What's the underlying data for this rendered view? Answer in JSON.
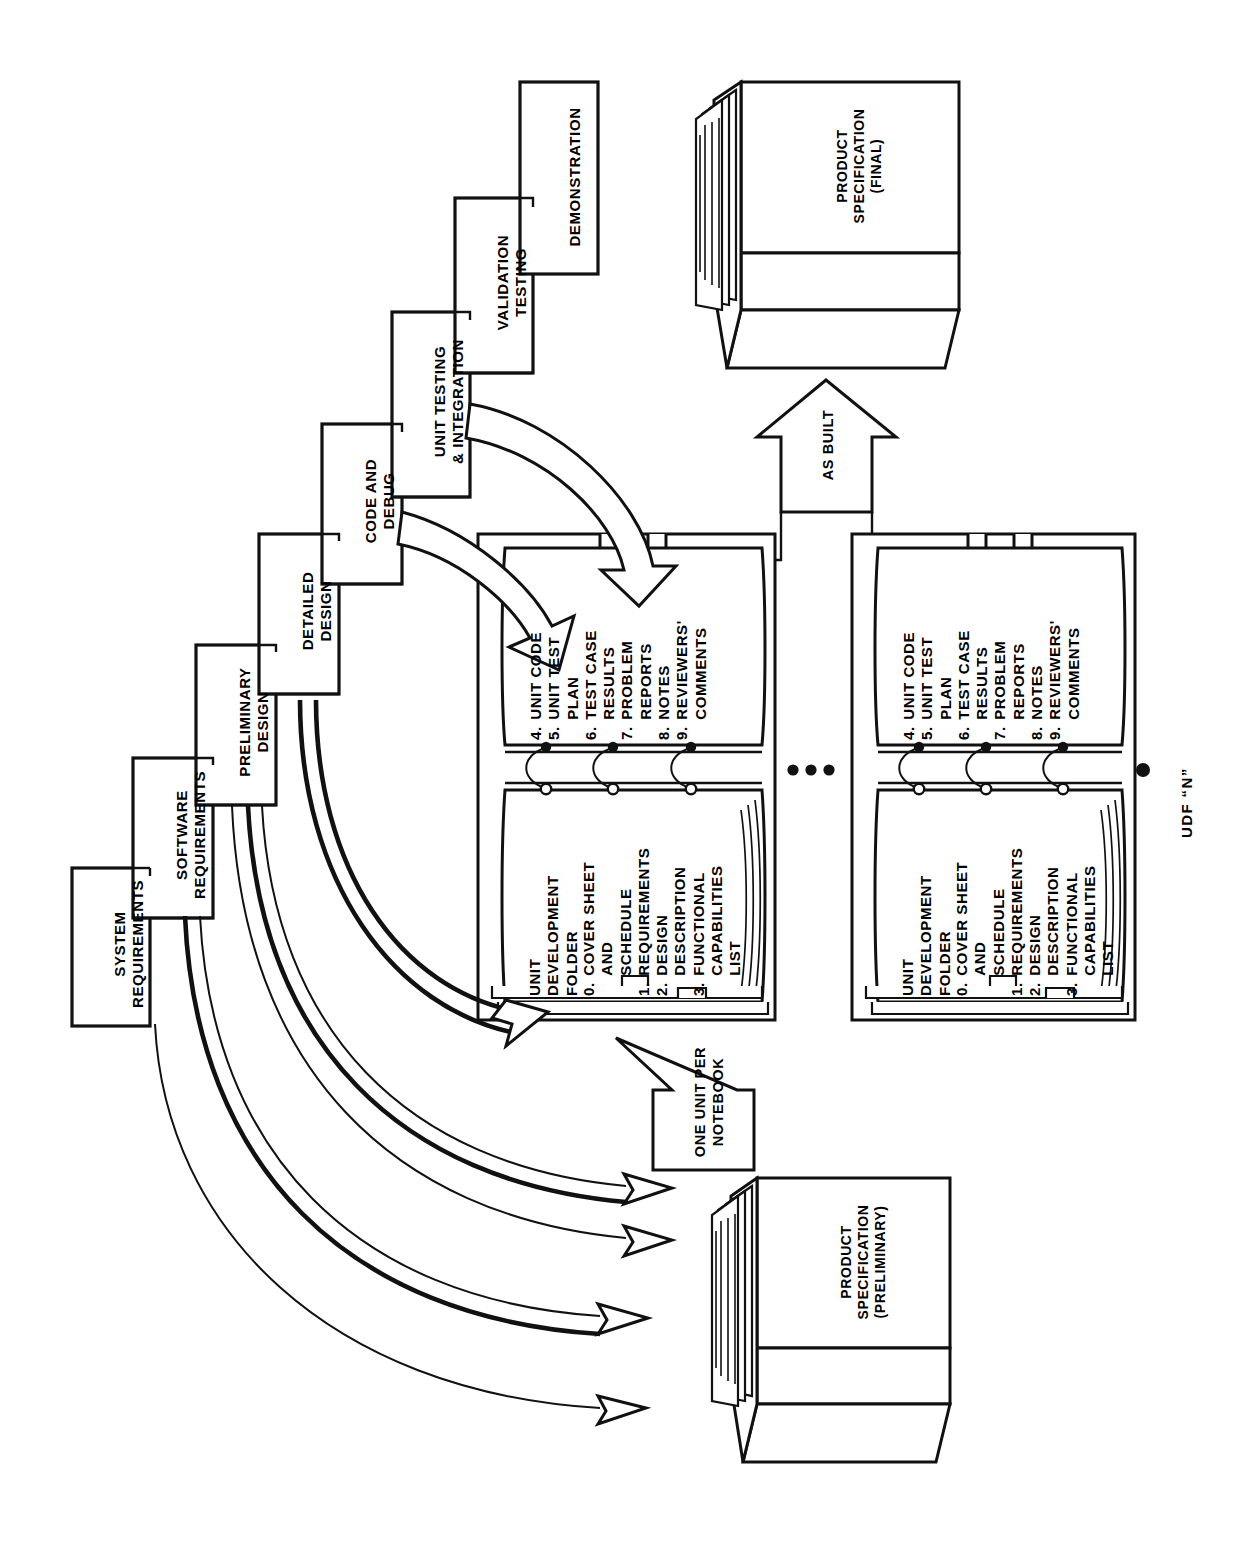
{
  "diagram": {
    "orientation": "rotated-90-ccw",
    "phases": [
      {
        "id": "system-requirements",
        "label": "SYSTEM\nREQUIREMENTS"
      },
      {
        "id": "software-requirements",
        "label": "SOFTWARE\nREQUIREMENTS"
      },
      {
        "id": "preliminary-design",
        "label": "PRELIMINARY\nDESIGN"
      },
      {
        "id": "detailed-design",
        "label": "DETAILED\nDESIGN"
      },
      {
        "id": "code-and-debug",
        "label": "CODE AND\nDEBUG"
      },
      {
        "id": "unit-testing",
        "label": "UNIT TESTING\n& INTEGRATION"
      },
      {
        "id": "validation-testing",
        "label": "VALIDATION\nTESTING"
      },
      {
        "id": "demonstration",
        "label": "DEMONSTRATION"
      }
    ],
    "documents": [
      {
        "id": "product-spec-final",
        "label": "PRODUCT\nSPECIFICATION\n(FINAL)"
      },
      {
        "id": "product-spec-preliminary",
        "label": "PRODUCT\nSPECIFICATION\n(PRELIMINARY)"
      }
    ],
    "flow_labels": {
      "as_built": "AS BUILT",
      "one_unit_per_notebook": "ONE UNIT PER\nNOTEBOOK"
    },
    "udf": {
      "heading": "UNIT\nDEVELOPMENT\nFOLDER",
      "left_page_items": [
        {
          "num": "0.",
          "text": "COVER SHEET\nAND\nSCHEDULE"
        },
        {
          "num": "1.",
          "text": "REQUIREMENTS"
        },
        {
          "num": "2.",
          "text": "DESIGN\nDESCRIPTION"
        },
        {
          "num": "3.",
          "text": "FUNCTIONAL\nCAPABILITIES\nLIST"
        }
      ],
      "right_page_items": [
        {
          "num": "4.",
          "text": "UNIT CODE"
        },
        {
          "num": "5.",
          "text": "UNIT TEST\nPLAN"
        },
        {
          "num": "6.",
          "text": "TEST CASE\nRESULTS"
        },
        {
          "num": "7.",
          "text": "PROBLEM\nREPORTS"
        },
        {
          "num": "8.",
          "text": "NOTES"
        },
        {
          "num": "9.",
          "text": "REVIEWERS'\nCOMMENTS"
        }
      ],
      "last_label": "UDF “N”",
      "ellipsis": "• • •"
    },
    "colors": {
      "ink": "#111111",
      "paper": "#ffffff"
    }
  }
}
